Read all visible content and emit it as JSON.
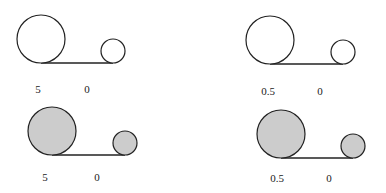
{
  "colors": {
    "stroke": "#222222",
    "fill_shaded": "#cccccc",
    "fill_empty": "#ffffff"
  },
  "panels": [
    {
      "id": "top-left",
      "shaded": false,
      "big": {
        "cx": 41,
        "cy": 39,
        "r": 24
      },
      "small": {
        "cx": 113,
        "cy": 51,
        "r": 12
      },
      "line_y": 63,
      "labels": [
        {
          "text": "5",
          "x": 38,
          "y": 84
        },
        {
          "text": "0",
          "x": 87,
          "y": 84
        }
      ]
    },
    {
      "id": "top-right",
      "shaded": false,
      "big": {
        "cx": 270,
        "cy": 40,
        "r": 24
      },
      "small": {
        "cx": 343,
        "cy": 52,
        "r": 12
      },
      "line_y": 64,
      "labels": [
        {
          "text": "0.5",
          "x": 268,
          "y": 86
        },
        {
          "text": "0",
          "x": 320,
          "y": 86
        }
      ]
    },
    {
      "id": "bottom-left",
      "shaded": true,
      "big": {
        "cx": 52,
        "cy": 131,
        "r": 24
      },
      "small": {
        "cx": 125,
        "cy": 143,
        "r": 12
      },
      "line_y": 155,
      "labels": [
        {
          "text": "5",
          "x": 45,
          "y": 172
        },
        {
          "text": "0",
          "x": 97,
          "y": 172
        }
      ]
    },
    {
      "id": "bottom-right",
      "shaded": true,
      "big": {
        "cx": 281,
        "cy": 134,
        "r": 24
      },
      "small": {
        "cx": 353,
        "cy": 146,
        "r": 12
      },
      "line_y": 158,
      "labels": [
        {
          "text": "0.5",
          "x": 277,
          "y": 173
        },
        {
          "text": "0",
          "x": 329,
          "y": 173
        }
      ]
    }
  ]
}
